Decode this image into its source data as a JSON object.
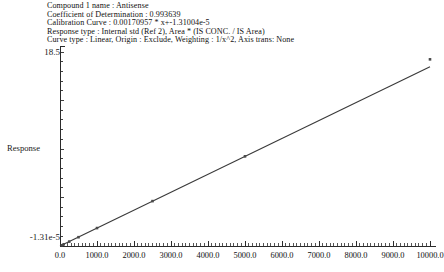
{
  "header": {
    "lines": [
      "Compound 1 name : Antisense",
      "Coefficient of Determination : 0.993639",
      "Calibration Curve :  0.00170957 * x+-1.31004e-5",
      "Response type : Internal std (Ref 2), Area * (IS CONC. / IS Area)",
      "Curve type : Linear, Origin : Exclude, Weighting : 1/x^2, Axis trans: None"
    ]
  },
  "chart_data": {
    "type": "scatter",
    "title": "",
    "xlabel": "",
    "ylabel": "Response",
    "xlim": [
      0,
      10000
    ],
    "ylim": [
      -1.31e-05,
      18.5
    ],
    "ytick_labels": [
      "18.5",
      "-1.31e-5"
    ],
    "xtick_labels": [
      "0.0",
      "1000.0",
      "2000.0",
      "3000.0",
      "4000.0",
      "5000.0",
      "6000.0",
      "7000.0",
      "8000.0",
      "9000.0",
      "10000.0"
    ],
    "xticks": [
      0,
      1000,
      2000,
      3000,
      4000,
      5000,
      6000,
      7000,
      8000,
      9000,
      10000
    ],
    "grid": false,
    "legend": null,
    "fit_line": {
      "slope": 0.00170957,
      "intercept": -1.31004e-05,
      "r_squared": 0.993639,
      "x_start": 0,
      "x_end": 10000,
      "y_start": 0.0,
      "y_end": 17.0957
    },
    "points": [
      {
        "x": 50,
        "y": 0.07
      },
      {
        "x": 100,
        "y": 0.16
      },
      {
        "x": 250,
        "y": 0.42
      },
      {
        "x": 500,
        "y": 0.84
      },
      {
        "x": 1000,
        "y": 1.71
      },
      {
        "x": 2500,
        "y": 4.28
      },
      {
        "x": 5000,
        "y": 8.55
      },
      {
        "x": 10000,
        "y": 17.8
      }
    ],
    "colors": {
      "axis": "#2b2b2b",
      "line": "#3a3a3a",
      "marker": "#4a4a4a",
      "background": "#ffffff"
    }
  }
}
